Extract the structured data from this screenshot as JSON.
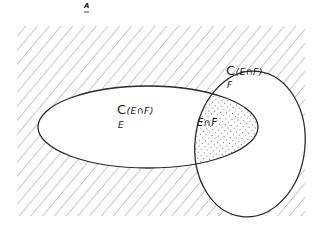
{
  "figure": {
    "corner_mark": "A",
    "universe": {
      "name": "A",
      "fill": "hatched",
      "hatch_color": "#9a9a9a"
    },
    "set_E": {
      "name": "E",
      "shape": "ellipse"
    },
    "set_F": {
      "name": "F",
      "shape": "ellipse"
    },
    "labels": {
      "complement_E": {
        "symbol": "C",
        "arg": "(E∩F)",
        "subscript": "E"
      },
      "complement_F": {
        "symbol": "C",
        "arg": "(E∩F)",
        "subscript": "F"
      },
      "intersection": "E∩F"
    },
    "colors": {
      "stroke": "#2a2a2a",
      "hatch": "#9a9a9a",
      "dots": "#555555",
      "background": "#ffffff"
    }
  }
}
